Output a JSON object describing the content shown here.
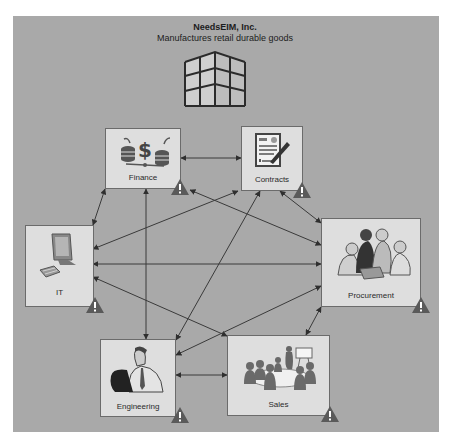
{
  "company": {
    "name": "NeedsEIM, Inc.",
    "description": "Manufactures retail durable goods",
    "icon": "building-icon"
  },
  "departments": [
    {
      "id": "finance",
      "label": "Finance",
      "icon": "finance-coins-dollar-icon",
      "warning": true
    },
    {
      "id": "contracts",
      "label": "Contracts",
      "icon": "contract-document-pen-icon",
      "warning": true
    },
    {
      "id": "it",
      "label": "IT",
      "icon": "computer-monitor-keyboard-icon",
      "warning": true
    },
    {
      "id": "procurement",
      "label": "Procurement",
      "icon": "team-meeting-icon",
      "warning": true
    },
    {
      "id": "engineering",
      "label": "Engineering",
      "icon": "engineer-at-computer-icon",
      "warning": true
    },
    {
      "id": "sales",
      "label": "Sales",
      "icon": "presentation-meeting-icon",
      "warning": true
    }
  ],
  "connections": [
    [
      "finance",
      "contracts"
    ],
    [
      "finance",
      "it"
    ],
    [
      "finance",
      "engineering"
    ],
    [
      "finance",
      "procurement"
    ],
    [
      "contracts",
      "it"
    ],
    [
      "contracts",
      "engineering"
    ],
    [
      "contracts",
      "procurement"
    ],
    [
      "it",
      "procurement"
    ],
    [
      "it",
      "sales"
    ],
    [
      "engineering",
      "procurement"
    ],
    [
      "engineering",
      "sales"
    ],
    [
      "procurement",
      "sales"
    ]
  ],
  "colors": {
    "background": "#a9a9a9",
    "box_fill": "#dedede",
    "box_border": "#6b6b6b",
    "arrow": "#3a3a3a",
    "warning": "#5a5a5a"
  }
}
